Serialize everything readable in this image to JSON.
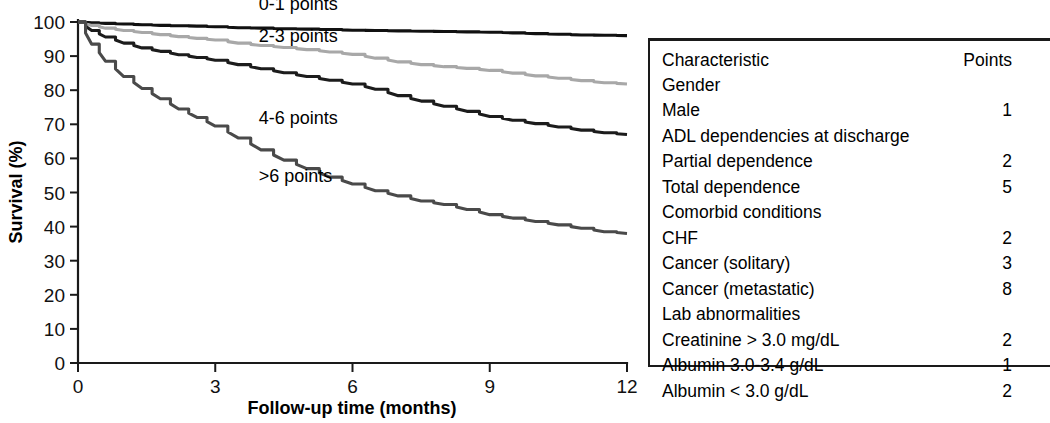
{
  "chart_data": {
    "type": "line",
    "title": "",
    "xlabel": "Follow-up time (months)",
    "ylabel": "Survival (%)",
    "xlim": [
      0,
      12
    ],
    "ylim": [
      0,
      100
    ],
    "xticks": [
      "0",
      "3",
      "6",
      "9",
      "12"
    ],
    "yticks": [
      "0",
      "10",
      "20",
      "30",
      "40",
      "50",
      "60",
      "70",
      "80",
      "90",
      "100"
    ],
    "grid": false,
    "legend_position": "inline-labels",
    "series": [
      {
        "name": "0-1 points",
        "color": "#111111",
        "label_x": 3.95,
        "label_y": 103.5,
        "x": [
          0,
          0.3,
          0.6,
          1.0,
          1.4,
          1.8,
          2.2,
          2.6,
          3.0,
          3.5,
          4.0,
          4.5,
          5.0,
          5.5,
          6.0,
          6.5,
          7.0,
          7.5,
          8.0,
          8.5,
          9.0,
          9.5,
          10.0,
          10.5,
          11.0,
          11.5,
          12.0
        ],
        "values": [
          100,
          99.8,
          99.6,
          99.4,
          99.2,
          99.0,
          98.9,
          98.8,
          98.6,
          98.3,
          98.2,
          98.0,
          97.9,
          97.8,
          97.6,
          97.5,
          97.4,
          97.3,
          97.2,
          97.1,
          97.0,
          96.8,
          96.6,
          96.4,
          96.2,
          96.1,
          96.0
        ]
      },
      {
        "name": "2-3 points",
        "color": "#a8a8a8",
        "label_x": 3.95,
        "label_y": 94.0,
        "x": [
          0,
          0.3,
          0.6,
          1.0,
          1.4,
          1.8,
          2.2,
          2.6,
          3.0,
          3.5,
          4.0,
          4.5,
          5.0,
          5.5,
          6.0,
          6.5,
          7.0,
          7.5,
          8.0,
          8.5,
          9.0,
          9.5,
          10.0,
          10.5,
          11.0,
          11.5,
          12.0
        ],
        "values": [
          100,
          99.0,
          98.2,
          97.5,
          96.9,
          96.3,
          95.7,
          95.2,
          94.7,
          93.8,
          93.1,
          92.5,
          91.9,
          91.2,
          90.5,
          89.4,
          88.3,
          87.5,
          86.9,
          86.4,
          85.8,
          85.0,
          84.2,
          83.5,
          82.8,
          82.2,
          81.8
        ]
      },
      {
        "name": "4-6 points",
        "color": "#1c1c1c",
        "label_x": 3.95,
        "label_y": 70.0,
        "x": [
          0,
          0.3,
          0.6,
          1.0,
          1.4,
          1.8,
          2.2,
          2.6,
          3.0,
          3.5,
          4.0,
          4.5,
          5.0,
          5.5,
          6.0,
          6.5,
          7.0,
          7.5,
          8.0,
          8.5,
          9.0,
          9.5,
          10.0,
          10.5,
          11.0,
          11.5,
          12.0
        ],
        "values": [
          100,
          97.5,
          95.6,
          93.8,
          92.4,
          91.4,
          90.4,
          89.6,
          88.8,
          87.5,
          86.3,
          85.1,
          84.0,
          82.9,
          81.8,
          80.3,
          78.4,
          76.8,
          75.3,
          73.8,
          72.3,
          71.2,
          70.2,
          69.2,
          68.3,
          67.5,
          67.0
        ]
      },
      {
        "name": ">6 points",
        "color": "#4a4a4a",
        "label_x": 3.95,
        "label_y": 53.0,
        "x": [
          0,
          0.3,
          0.6,
          1.0,
          1.4,
          1.8,
          2.2,
          2.6,
          3.0,
          3.5,
          4.0,
          4.5,
          5.0,
          5.5,
          6.0,
          6.5,
          7.0,
          7.5,
          8.0,
          8.5,
          9.0,
          9.5,
          10.0,
          10.5,
          11.0,
          11.5,
          12.0
        ],
        "values": [
          100,
          93.5,
          88.5,
          84.0,
          80.5,
          77.5,
          74.5,
          72.0,
          69.5,
          66.0,
          62.5,
          59.5,
          57.0,
          54.5,
          52.5,
          50.5,
          49.0,
          47.5,
          46.5,
          45.0,
          43.5,
          42.5,
          41.5,
          40.5,
          39.5,
          38.5,
          38.0
        ]
      }
    ]
  },
  "score_table": {
    "header": {
      "characteristic": "Characteristic",
      "points": "Points"
    },
    "rows": [
      {
        "label": "Gender",
        "points": "",
        "level": 1
      },
      {
        "label": "Male",
        "points": "1",
        "level": 2
      },
      {
        "label": "ADL dependencies at discharge",
        "points": "",
        "level": 1
      },
      {
        "label": "Partial dependence",
        "points": "2",
        "level": 2
      },
      {
        "label": "Total dependence",
        "points": "5",
        "level": 2
      },
      {
        "label": "Comorbid conditions",
        "points": "",
        "level": 1
      },
      {
        "label": "CHF",
        "points": "2",
        "level": 2
      },
      {
        "label": "Cancer (solitary)",
        "points": "3",
        "level": 2
      },
      {
        "label": "Cancer (metastatic)",
        "points": "8",
        "level": 2
      },
      {
        "label": "Lab abnormalities",
        "points": "",
        "level": 1
      },
      {
        "label": "Creatinine > 3.0 mg/dL",
        "points": "2",
        "level": 2
      },
      {
        "label": "Albumin 3.0-3.4 g/dL",
        "points": "1",
        "level": 2
      },
      {
        "label": "Albumin < 3.0 g/dL",
        "points": "2",
        "level": 2
      }
    ]
  }
}
